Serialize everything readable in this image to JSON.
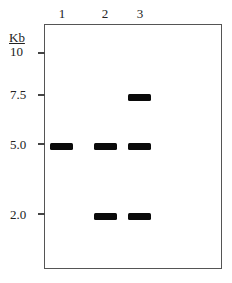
{
  "gel": {
    "unit_label": "Kb",
    "lanes": [
      {
        "label": "1",
        "bands_kb": [
          5.0
        ]
      },
      {
        "label": "2",
        "bands_kb": [
          5.0,
          2.0
        ]
      },
      {
        "label": "3",
        "bands_kb": [
          7.5,
          5.0,
          2.0
        ]
      }
    ],
    "markers": [
      {
        "label": "10",
        "kb": 10
      },
      {
        "label": "7.5",
        "kb": 7.5
      },
      {
        "label": "5.0",
        "kb": 5.0
      },
      {
        "label": "2.0",
        "kb": 2.0
      }
    ],
    "colors": {
      "band": "#0a0a0a",
      "border": "#555555",
      "background": "#ffffff"
    }
  }
}
